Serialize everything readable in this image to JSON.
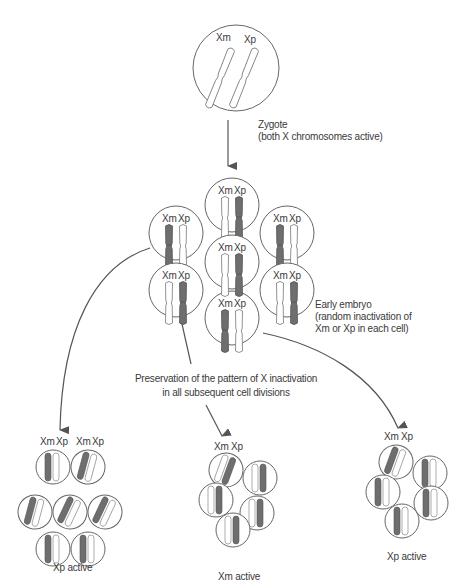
{
  "labels": {
    "xm": "Xm",
    "xp": "Xp"
  },
  "zygote": {
    "caption_line1": "Zygote",
    "caption_line2": "(both X chromosomes active)"
  },
  "embryo": {
    "caption_line1": "Early embryo",
    "caption_line2": "(random inactivation of",
    "caption_line3": "Xm or Xp in each cell)",
    "cells": [
      {
        "position": "top",
        "inactive": "Xp"
      },
      {
        "position": "upper-left",
        "inactive": "Xm"
      },
      {
        "position": "upper-right",
        "inactive": "Xm"
      },
      {
        "position": "center",
        "inactive": "Xp"
      },
      {
        "position": "lower-left",
        "inactive": "Xp"
      },
      {
        "position": "lower-right",
        "inactive": "Xp"
      },
      {
        "position": "bottom",
        "inactive": "Xm"
      }
    ]
  },
  "preservation": {
    "line1": "Preservation of the pattern of X inactivation",
    "line2": "in all subsequent cell divisions"
  },
  "clones": [
    {
      "caption": "Xp active",
      "cell_count": 7,
      "inactive": "Xm"
    },
    {
      "caption": "Xm active",
      "cell_count": 5,
      "inactive": "Xp"
    },
    {
      "caption": "Xp active",
      "cell_count": 5,
      "inactive": "Xm"
    }
  ],
  "colors": {
    "line": "#555555",
    "inactive_fill": "#6e6e6e",
    "active_fill": "#ffffff",
    "text": "#3a3a3a"
  }
}
